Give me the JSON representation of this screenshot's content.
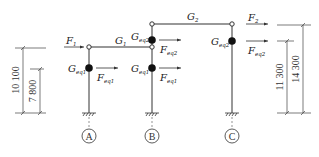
{
  "figure": {
    "type": "structural-frame-diagram",
    "line_color": "#333333",
    "mass_color": "#111111"
  },
  "beams": [
    {
      "label": "G",
      "sub": "1"
    },
    {
      "label": "G",
      "sub": "2"
    }
  ],
  "masses": {
    "a_lower": {
      "label": "G",
      "sub": "eq1"
    },
    "b_lower": {
      "label": "G",
      "sub": "eq1"
    },
    "b_upper": {
      "label": "G",
      "sub": "eq2"
    },
    "c_upper": {
      "label": "G",
      "sub": "eq2"
    }
  },
  "forces": {
    "f1": {
      "label": "F",
      "sub": "1"
    },
    "f2": {
      "label": "F",
      "sub": "2"
    },
    "a_lower": {
      "label": "F",
      "sub": "eq1"
    },
    "b_lower": {
      "label": "F",
      "sub": "eq1"
    },
    "b_upper": {
      "label": "F",
      "sub": "eq2"
    },
    "c_upper": {
      "label": "F",
      "sub": "eq2"
    }
  },
  "axes": [
    {
      "label": "A"
    },
    {
      "label": "B"
    },
    {
      "label": "C"
    }
  ],
  "dimensions": {
    "left_outer": "10 100",
    "left_inner": "7 800",
    "right_inner": "11 300",
    "right_outer": "14 300"
  }
}
